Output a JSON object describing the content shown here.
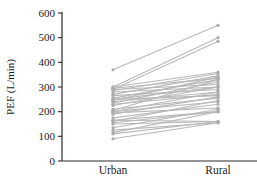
{
  "chart_data": {
    "type": "line",
    "subtype": "paired-slope-plot",
    "title": "",
    "xlabel": "",
    "ylabel": "PEF (L/min)",
    "categories": [
      "Urban",
      "Rural"
    ],
    "ylim": [
      0,
      600
    ],
    "yticks": [
      0,
      100,
      200,
      300,
      400,
      500,
      600
    ],
    "grid": false,
    "legend": false,
    "line_color": "#b8b8b8",
    "marker_color": "#ababab",
    "axis_color": "#2a2a2a",
    "pairs": [
      [
        370,
        550
      ],
      [
        300,
        500
      ],
      [
        290,
        485
      ],
      [
        300,
        360
      ],
      [
        295,
        335
      ],
      [
        290,
        310
      ],
      [
        285,
        355
      ],
      [
        280,
        300
      ],
      [
        270,
        345
      ],
      [
        265,
        290
      ],
      [
        255,
        330
      ],
      [
        250,
        300
      ],
      [
        250,
        265
      ],
      [
        245,
        340
      ],
      [
        240,
        280
      ],
      [
        235,
        320
      ],
      [
        230,
        270
      ],
      [
        225,
        300
      ],
      [
        210,
        255
      ],
      [
        205,
        330
      ],
      [
        200,
        280
      ],
      [
        200,
        240
      ],
      [
        195,
        215
      ],
      [
        190,
        260
      ],
      [
        175,
        230
      ],
      [
        165,
        200
      ],
      [
        165,
        160
      ],
      [
        160,
        245
      ],
      [
        155,
        200
      ],
      [
        150,
        160
      ],
      [
        135,
        210
      ],
      [
        125,
        155
      ],
      [
        115,
        200
      ],
      [
        110,
        160
      ],
      [
        90,
        155
      ]
    ]
  }
}
